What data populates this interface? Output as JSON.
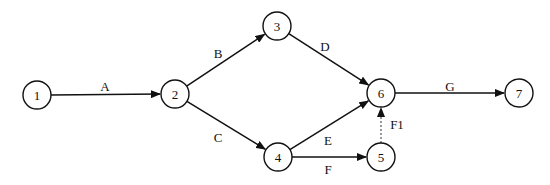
{
  "diagram": {
    "type": "activity-on-arrow network",
    "nodes": [
      {
        "id": "1",
        "label": "1",
        "x": 37,
        "y": 95,
        "r": 14
      },
      {
        "id": "2",
        "label": "2",
        "x": 175,
        "y": 94,
        "r": 14
      },
      {
        "id": "3",
        "label": "3",
        "x": 277,
        "y": 26,
        "r": 14
      },
      {
        "id": "4",
        "label": "4",
        "x": 278,
        "y": 157,
        "r": 14
      },
      {
        "id": "5",
        "label": "5",
        "x": 381,
        "y": 157,
        "r": 14
      },
      {
        "id": "6",
        "label": "6",
        "x": 381,
        "y": 93,
        "r": 14
      },
      {
        "id": "7",
        "label": "7",
        "x": 519,
        "y": 93,
        "r": 14
      }
    ],
    "edges": [
      {
        "from": "1",
        "to": "2",
        "label": "A",
        "lx": 105,
        "ly": 86,
        "style": "solid"
      },
      {
        "from": "2",
        "to": "3",
        "label": "B",
        "lx": 218,
        "ly": 53,
        "style": "solid"
      },
      {
        "from": "2",
        "to": "4",
        "label": "C",
        "lx": 218,
        "ly": 137,
        "style": "solid"
      },
      {
        "from": "3",
        "to": "6",
        "label": "D",
        "lx": 325,
        "ly": 46,
        "style": "solid"
      },
      {
        "from": "4",
        "to": "6",
        "label": "E",
        "lx": 328,
        "ly": 140,
        "style": "solid"
      },
      {
        "from": "4",
        "to": "5",
        "label": "F",
        "lx": 328,
        "ly": 169,
        "style": "solid"
      },
      {
        "from": "5",
        "to": "6",
        "label": "F1",
        "lx": 397,
        "ly": 124,
        "style": "dashed"
      },
      {
        "from": "6",
        "to": "7",
        "label": "G",
        "lx": 450,
        "ly": 86,
        "style": "solid"
      }
    ]
  }
}
